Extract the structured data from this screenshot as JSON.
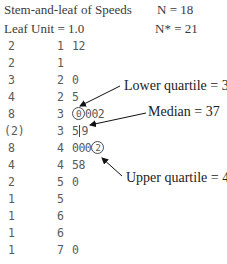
{
  "header": {
    "title": "Stem-and-leaf of Speeds",
    "n_label": "N = 18",
    "leaf_unit": "Leaf Unit = 1.0",
    "n_missing_label": "N* = 21"
  },
  "rows": [
    {
      "depth": "2",
      "stem": "1",
      "leaves": "12"
    },
    {
      "depth": "2",
      "stem": "1",
      "leaves": ""
    },
    {
      "depth": "3",
      "stem": "2",
      "leaves": "0"
    },
    {
      "depth": "4",
      "stem": "2",
      "leaves": "5"
    },
    {
      "depth": "8",
      "stem": "3",
      "leaves_circled": "0",
      "leaves_rest": "002"
    },
    {
      "depth": "(2)",
      "stem": "3",
      "leaves_before_bar": "5",
      "leaves_after_bar": "9"
    },
    {
      "depth": "8",
      "stem": "4",
      "leaves_plain": "000",
      "leaves_circled": "2"
    },
    {
      "depth": "4",
      "stem": "4",
      "leaves": "58"
    },
    {
      "depth": "2",
      "stem": "5",
      "leaves": "0"
    },
    {
      "depth": "1",
      "stem": "5",
      "leaves": ""
    },
    {
      "depth": "1",
      "stem": "6",
      "leaves": ""
    },
    {
      "depth": "1",
      "stem": "6",
      "leaves": ""
    },
    {
      "depth": "1",
      "stem": "7",
      "leaves": "0"
    }
  ],
  "annotations": {
    "lower_quartile": "Lower quartile = 30",
    "median": "Median = 37",
    "upper_quartile": "Upper quartile = 42"
  },
  "colors": {
    "text": "#4a4a4a",
    "annotation": "#222222",
    "background": "#ffffff"
  }
}
